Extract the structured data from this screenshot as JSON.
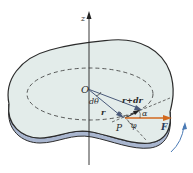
{
  "diagram": {
    "type": "rigid body rotation - work done by force",
    "labels": {
      "z_axis": "z",
      "origin": "O",
      "point": "P",
      "r": "r",
      "r_plus_dr": "r+dr",
      "dtheta": "dθ",
      "alpha": "α",
      "phi": "φ",
      "force": "F"
    },
    "colors": {
      "plate_fill": "#e3ecea",
      "plate_edge": "#9aa9c4",
      "outline": "#2b2b2b",
      "vectors": "#4a5a7a",
      "force": "#d2691e",
      "rotation_arrow": "#4a7ab5"
    }
  }
}
